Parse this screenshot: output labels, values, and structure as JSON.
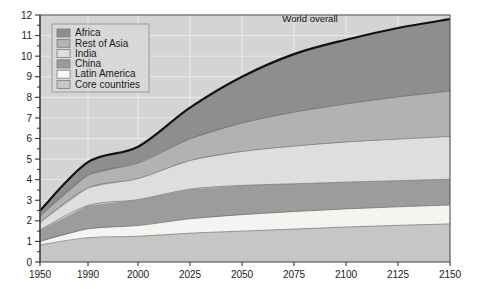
{
  "chart_data": {
    "type": "area",
    "stacked": true,
    "title": "",
    "subtitle": "",
    "xlabel": "",
    "ylabel": "",
    "xlim": [
      1950,
      2150
    ],
    "ylim": [
      0,
      12
    ],
    "grid": true,
    "legend_position": "top-left",
    "annotations": [
      {
        "text": "World overall",
        "x": 2085,
        "y": 11.55
      }
    ],
    "x": [
      1950,
      1990,
      2000,
      2025,
      2050,
      2075,
      2100,
      2125,
      2150
    ],
    "x_tick_labels": [
      "1950",
      "1990",
      "2000",
      "2025",
      "2050",
      "2075",
      "2100",
      "2125",
      "2150"
    ],
    "x_tick_positions_px": [
      40,
      88,
      138,
      190,
      242,
      294,
      346,
      398,
      450
    ],
    "y_tick_labels": [
      "0",
      "1",
      "2",
      "3",
      "4",
      "5",
      "6",
      "7",
      "8",
      "9",
      "10",
      "11",
      "12"
    ],
    "y_ticks": [
      0,
      1,
      2,
      3,
      4,
      5,
      6,
      7,
      8,
      9,
      10,
      11,
      12
    ],
    "series": [
      {
        "name": "Core countries",
        "color": "#c6c6c6",
        "values": [
          0.83,
          1.18,
          1.25,
          1.4,
          1.5,
          1.6,
          1.7,
          1.78,
          1.85
        ]
      },
      {
        "name": "Latin America",
        "color": "#f4f4f0",
        "values": [
          0.17,
          0.43,
          0.52,
          0.7,
          0.8,
          0.85,
          0.88,
          0.9,
          0.92
        ]
      },
      {
        "name": "China",
        "color": "#9c9c9c",
        "values": [
          0.56,
          1.13,
          1.26,
          1.44,
          1.42,
          1.35,
          1.3,
          1.27,
          1.25
        ]
      },
      {
        "name": "India",
        "color": "#dedede",
        "values": [
          0.36,
          0.85,
          1.02,
          1.39,
          1.65,
          1.83,
          1.95,
          2.02,
          2.08
        ]
      },
      {
        "name": "Rest of Asia",
        "color": "#b2b2b2",
        "values": [
          0.3,
          0.62,
          0.75,
          1.05,
          1.38,
          1.65,
          1.85,
          2.05,
          2.2
        ]
      },
      {
        "name": "Africa",
        "color": "#8e8e8e",
        "values": [
          0.28,
          0.64,
          0.8,
          1.52,
          2.25,
          2.82,
          3.12,
          3.35,
          3.5
        ]
      }
    ],
    "totals": [
      2.5,
      4.85,
      5.6,
      7.5,
      9.0,
      10.1,
      10.8,
      11.37,
      11.8
    ],
    "total_line_label": "World overall",
    "total_line_color": "#111111"
  },
  "legend": {
    "items": [
      {
        "label": "Africa",
        "color": "#8e8e8e"
      },
      {
        "label": "Rest of Asia",
        "color": "#b2b2b2"
      },
      {
        "label": "India",
        "color": "#dedede"
      },
      {
        "label": "China",
        "color": "#9c9c9c"
      },
      {
        "label": "Latin America",
        "color": "#f7f7f4"
      },
      {
        "label": "Core countries",
        "color": "#c6c6c6"
      }
    ]
  },
  "style": {
    "plot_background": "#d4d4d4",
    "grid_color": "#eeeeee",
    "frame_color": "#555555",
    "band_edge_color": "#6b6b6b",
    "legend_background": "#d8d8d8",
    "legend_border": "#9a9a9a",
    "tick_color": "#333333",
    "text_color": "#1a1a1a"
  }
}
